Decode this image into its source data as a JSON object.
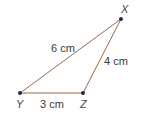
{
  "diagram": {
    "type": "triangle",
    "colors": {
      "edge": "#9a6a4a",
      "vertex": "#1f2a44",
      "text": "#3a3a3a"
    },
    "vertices": {
      "X": {
        "label": "X",
        "x": 121,
        "y": 19
      },
      "Y": {
        "label": "Y",
        "x": 20,
        "y": 93
      },
      "Z": {
        "label": "Z",
        "x": 83,
        "y": 93
      }
    },
    "edges": [
      {
        "from": "Y",
        "to": "X",
        "label": "6 cm"
      },
      {
        "from": "Z",
        "to": "X",
        "label": "4 cm"
      },
      {
        "from": "Y",
        "to": "Z",
        "label": "3 cm"
      }
    ]
  }
}
